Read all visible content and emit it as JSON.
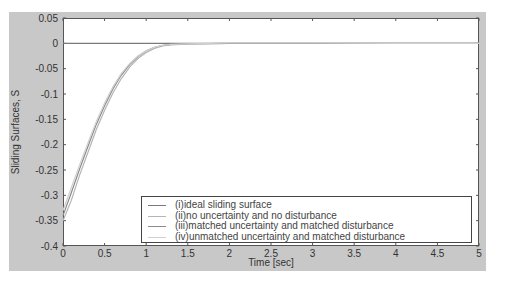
{
  "chart_data": {
    "type": "line",
    "title": "",
    "xlabel": "Time [sec]",
    "ylabel": "Sliding Surfaces, S",
    "xlim": [
      0,
      5
    ],
    "ylim": [
      -0.4,
      0.05
    ],
    "xticks": [
      0,
      0.5,
      1,
      1.5,
      2,
      2.5,
      3,
      3.5,
      4,
      4.5,
      5
    ],
    "xtick_labels": [
      "0",
      "0.5",
      "1",
      "1.5",
      "2",
      "2.5",
      "3",
      "3.5",
      "4",
      "4.5",
      "5"
    ],
    "yticks": [
      0.05,
      0,
      -0.05,
      -0.1,
      -0.15,
      -0.2,
      -0.25,
      -0.3,
      -0.35,
      -0.4
    ],
    "ytick_labels": [
      "0.05",
      "0",
      "-0.05",
      "-0.1",
      "-0.15",
      "-0.2",
      "-0.25",
      "-0.3",
      "-0.35",
      "-0.4"
    ],
    "grid": false,
    "legend_position": "lower right",
    "series": [
      {
        "name": "(i)ideal sliding surface",
        "color": "#7a7a7a",
        "x": [
          0,
          5
        ],
        "y": [
          0,
          0
        ]
      },
      {
        "name": "(ii)no uncertainty and no disturbance",
        "color": "#b5b5b5",
        "x": [
          0,
          0.1,
          0.2,
          0.3,
          0.4,
          0.5,
          0.6,
          0.7,
          0.8,
          0.9,
          1.0,
          1.1,
          1.2,
          1.3,
          1.5,
          2.0,
          3.0,
          4.0,
          5.0
        ],
        "y": [
          -0.35,
          -0.31,
          -0.26,
          -0.215,
          -0.17,
          -0.132,
          -0.098,
          -0.07,
          -0.047,
          -0.03,
          -0.018,
          -0.01,
          -0.005,
          -0.003,
          -0.001,
          0,
          0,
          0,
          0
        ]
      },
      {
        "name": "(iii)matched uncertainty and matched disturbance",
        "color": "#8c8c8c",
        "x": [
          0,
          0.1,
          0.2,
          0.3,
          0.4,
          0.5,
          0.6,
          0.7,
          0.8,
          0.9,
          1.0,
          1.1,
          1.2,
          1.3,
          1.5,
          2.0,
          3.0,
          4.0,
          5.0
        ],
        "y": [
          -0.34,
          -0.295,
          -0.248,
          -0.203,
          -0.16,
          -0.123,
          -0.09,
          -0.063,
          -0.042,
          -0.026,
          -0.015,
          -0.008,
          -0.004,
          -0.002,
          -0.001,
          0,
          0,
          0,
          0
        ]
      },
      {
        "name": "(iv)unmatched uncertainty and matched disturbance",
        "color": "#d0d0d0",
        "x": [
          0,
          0.1,
          0.2,
          0.3,
          0.4,
          0.5,
          0.6,
          0.7,
          0.8,
          0.9,
          1.0,
          1.1,
          1.2,
          1.3,
          1.5,
          2.0,
          3.0,
          4.0,
          5.0
        ],
        "y": [
          -0.33,
          -0.285,
          -0.24,
          -0.196,
          -0.154,
          -0.118,
          -0.086,
          -0.06,
          -0.04,
          -0.025,
          -0.015,
          -0.008,
          -0.004,
          -0.002,
          -0.001,
          0.001,
          0.001,
          0,
          0
        ]
      }
    ]
  },
  "legend": {
    "items": [
      {
        "label": "(i)ideal sliding surface",
        "color": "#7a7a7a"
      },
      {
        "label": "(ii)no uncertainty and no disturbance",
        "color": "#b5b5b5"
      },
      {
        "label": "(iii)matched uncertainty and matched disturbance",
        "color": "#8c8c8c"
      },
      {
        "label": "(iv)unmatched uncertainty and matched disturbance",
        "color": "#d0d0d0"
      }
    ]
  },
  "axes": {
    "xlabel": "Time [sec]",
    "ylabel": "Sliding Surfaces, S"
  }
}
